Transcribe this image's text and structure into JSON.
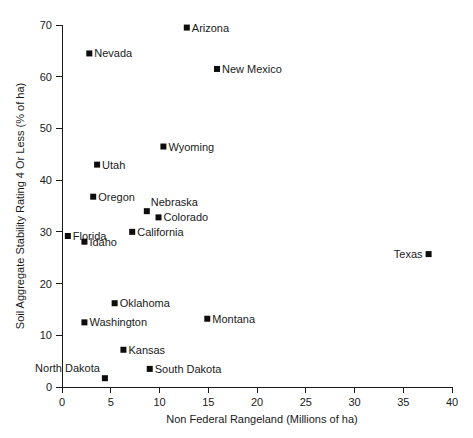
{
  "chart_data": {
    "type": "scatter",
    "title": "",
    "xlabel": "Non Federal Rangeland (Millions of ha)",
    "ylabel": "Soil Aggregate Stability Rating 4 Or Less (% of ha)",
    "xlim": [
      0,
      40
    ],
    "ylim": [
      0,
      70
    ],
    "xticks": [
      0,
      5,
      10,
      15,
      20,
      25,
      30,
      35,
      40
    ],
    "yticks": [
      0,
      10,
      20,
      30,
      40,
      50,
      60,
      70
    ],
    "xtick_labels": [
      "0",
      "5",
      "10",
      "15",
      "20",
      "25",
      "30",
      "35",
      "40"
    ],
    "ytick_labels": [
      "0",
      "10",
      "20",
      "30",
      "40",
      "50",
      "60",
      "70"
    ],
    "grid": false,
    "legend": false,
    "marker": "square",
    "marker_color": "#0d0d0d",
    "points": [
      {
        "label": "Arizona",
        "x": 12.8,
        "y": 69.5,
        "label_pos": "right"
      },
      {
        "label": "Nevada",
        "x": 2.8,
        "y": 64.5,
        "label_pos": "right"
      },
      {
        "label": "New Mexico",
        "x": 15.9,
        "y": 61.5,
        "label_pos": "right"
      },
      {
        "label": "Wyoming",
        "x": 10.4,
        "y": 46.5,
        "label_pos": "right"
      },
      {
        "label": "Utah",
        "x": 3.6,
        "y": 43.0,
        "label_pos": "right"
      },
      {
        "label": "Oregon",
        "x": 3.2,
        "y": 36.8,
        "label_pos": "right"
      },
      {
        "label": "Nebraska",
        "x": 8.7,
        "y": 34.0,
        "label_pos": "above-right"
      },
      {
        "label": "Colorado",
        "x": 9.9,
        "y": 32.8,
        "label_pos": "right"
      },
      {
        "label": "California",
        "x": 7.2,
        "y": 30.0,
        "label_pos": "right"
      },
      {
        "label": "Florida",
        "x": 0.6,
        "y": 29.2,
        "label_pos": "right"
      },
      {
        "label": "Idaho",
        "x": 2.3,
        "y": 28.1,
        "label_pos": "right"
      },
      {
        "label": "Texas",
        "x": 37.6,
        "y": 25.7,
        "label_pos": "left"
      },
      {
        "label": "Oklahoma",
        "x": 5.4,
        "y": 16.2,
        "label_pos": "right"
      },
      {
        "label": "Montana",
        "x": 14.9,
        "y": 13.2,
        "label_pos": "right"
      },
      {
        "label": "Washington",
        "x": 2.3,
        "y": 12.5,
        "label_pos": "right"
      },
      {
        "label": "Kansas",
        "x": 6.3,
        "y": 7.2,
        "label_pos": "right"
      },
      {
        "label": "South Dakota",
        "x": 9.0,
        "y": 3.5,
        "label_pos": "right"
      },
      {
        "label": "North Dakota",
        "x": 4.4,
        "y": 1.7,
        "label_pos": "above-left"
      }
    ]
  }
}
